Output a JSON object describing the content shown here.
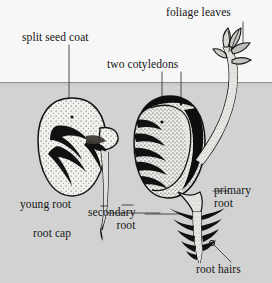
{
  "figure": {
    "width": 272,
    "height": 283
  },
  "colors": {
    "sky": "#f7f7f7",
    "soil": "#d2d2d2",
    "soil_line": "#9a9a9a",
    "ink": "#141414",
    "seed_fill": "#f2f1ee",
    "seed_coat_dark": "#121212",
    "stipple": "#2a2a2a",
    "leader": "#3a3a3a",
    "stem_fill": "#eceae6"
  },
  "labels": {
    "split_seed_coat": "split seed coat",
    "two_cotyledons": "two cotyledons",
    "foliage_leaves": "foliage leaves",
    "young_root": "young root",
    "root_cap": "root cap",
    "secondary_root": "secondary\nroot",
    "secondary_root_line1": "secondary",
    "secondary_root_line2": "root",
    "primary_root_line1": "primary",
    "primary_root_line2": "root",
    "root_hairs": "root hairs"
  },
  "scene": {
    "soil_surface_y": 82,
    "stages": [
      {
        "name": "early-germination-seed",
        "description": "Kidney-shaped stippled seed with split coat and emerging radicle",
        "center_x": 72,
        "center_y": 152
      },
      {
        "name": "advanced-seedling",
        "description": "Seed with dark split coat, cotyledon interior, shoot to foliage leaves and branched root system",
        "center_x": 172,
        "center_y": 150
      }
    ],
    "root_system": {
      "secondary_root_pairs": 5,
      "has_root_hairs": true,
      "has_root_cap": true
    }
  }
}
